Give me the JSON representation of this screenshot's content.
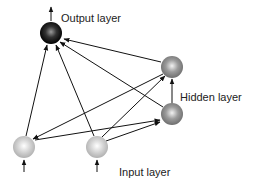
{
  "diagram": {
    "type": "recurrent neural network",
    "labels": {
      "output": "Output layer",
      "hidden": "Hidden layer",
      "input": "Input layer"
    },
    "nodes": [
      {
        "id": "output",
        "layer": "output",
        "x": 51,
        "y": 33,
        "color": "#1a1a1a"
      },
      {
        "id": "hidden_top",
        "layer": "hidden",
        "x": 172,
        "y": 67,
        "color": "#8a8a8a"
      },
      {
        "id": "hidden_bottom",
        "layer": "hidden",
        "x": 172,
        "y": 114,
        "color": "#8a8a8a"
      },
      {
        "id": "input_left",
        "layer": "input",
        "x": 24,
        "y": 147,
        "color": "#c8c8c8"
      },
      {
        "id": "input_mid",
        "layer": "input",
        "x": 97,
        "y": 147,
        "color": "#c8c8c8"
      }
    ],
    "edges": [
      {
        "from": "input_left",
        "to": "output"
      },
      {
        "from": "input_mid",
        "to": "output"
      },
      {
        "from": "hidden_top",
        "to": "output"
      },
      {
        "from": "hidden_bottom",
        "to": "output"
      },
      {
        "from": "hidden_bottom",
        "to": "hidden_top"
      },
      {
        "from": "hidden_top",
        "to": "input_left"
      },
      {
        "from": "input_left",
        "to": "hidden_bottom"
      },
      {
        "from": "input_mid",
        "to": "hidden_top"
      },
      {
        "from": "input_mid",
        "to": "hidden_bottom"
      }
    ],
    "external_arrows": [
      {
        "node": "output",
        "direction": "out-up"
      },
      {
        "node": "input_left",
        "direction": "in-up"
      },
      {
        "node": "input_mid",
        "direction": "in-up"
      }
    ]
  }
}
